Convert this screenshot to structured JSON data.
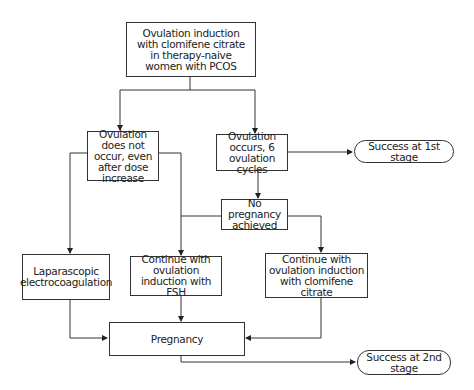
{
  "diagram": {
    "type": "flowchart",
    "nodes": {
      "start": "Ovulation induction with clomifene citrate in therapy-naive women with PCOS",
      "no_ovulation": "Ovulation does not occur, even after dose increase",
      "ovulation": "Ovulation occurs, 6 ovulation cycles",
      "success1": "Success at 1st stage",
      "no_pregnancy": "No pregnancy achieved",
      "laparoscopic": "Laparascopic electrocoagulation",
      "fsh": "Continue with ovulation induction with FSH",
      "clomifene": "Continue with ovulation induction with clomifene citrate",
      "pregnancy": "Pregnancy",
      "success2": "Success at 2nd stage"
    },
    "edges": [
      [
        "start",
        "no_ovulation"
      ],
      [
        "start",
        "ovulation"
      ],
      [
        "ovulation",
        "success1"
      ],
      [
        "ovulation",
        "no_pregnancy"
      ],
      [
        "no_ovulation",
        "laparoscopic"
      ],
      [
        "no_ovulation",
        "fsh"
      ],
      [
        "no_pregnancy",
        "fsh"
      ],
      [
        "no_pregnancy",
        "clomifene"
      ],
      [
        "laparoscopic",
        "pregnancy"
      ],
      [
        "fsh",
        "pregnancy"
      ],
      [
        "clomifene",
        "pregnancy"
      ],
      [
        "pregnancy",
        "success2"
      ]
    ]
  }
}
